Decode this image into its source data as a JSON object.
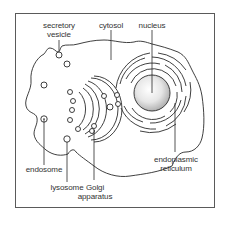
{
  "diagram": {
    "labels": {
      "secretory_vesicle": [
        "secretory",
        "vesicle"
      ],
      "cytosol": "cytosol",
      "nucleus": "nucleus",
      "endosome": "endosome",
      "lysosome": "lysosome",
      "golgi": [
        "Golgi",
        "apparatus"
      ],
      "er": [
        "endoplasmic",
        "reticulum"
      ]
    },
    "colors": {
      "stroke": "#2a2a2a",
      "frame": "#5a5a5a",
      "nucleus_light": "#ffffff",
      "nucleus_dark": "#b8b8b8"
    }
  }
}
